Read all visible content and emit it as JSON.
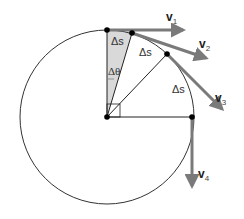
{
  "diagram": {
    "circle": {
      "cx": 107,
      "cy": 117,
      "r": 87,
      "stroke": "#333333"
    },
    "colors": {
      "arrow": "#7a7a7a",
      "wedge": "#d9d9d9",
      "line": "#222222",
      "point": "#000000"
    },
    "points": [
      {
        "id": "p1",
        "x": 107,
        "y": 30
      },
      {
        "id": "p2",
        "x": 132,
        "y": 33
      },
      {
        "id": "p3",
        "x": 167,
        "y": 54
      },
      {
        "id": "p4",
        "x": 192,
        "y": 117
      },
      {
        "id": "center",
        "x": 107,
        "y": 117
      }
    ],
    "vectors": [
      {
        "id": "v1",
        "label": "v",
        "sub": "1",
        "from": [
          107,
          30
        ],
        "to": [
          183,
          30
        ],
        "label_pos": [
          166,
          21
        ]
      },
      {
        "id": "v2",
        "label": "v",
        "sub": "2",
        "from": [
          132,
          33
        ],
        "to": [
          206,
          58
        ],
        "label_pos": [
          199,
          48
        ]
      },
      {
        "id": "v3",
        "label": "v",
        "sub": "3",
        "from": [
          167,
          54
        ],
        "to": [
          222,
          109
        ],
        "label_pos": [
          215,
          102
        ]
      },
      {
        "id": "v4",
        "label": "v",
        "sub": "4",
        "from": [
          192,
          117
        ],
        "to": [
          192,
          186
        ],
        "label_pos": [
          198,
          178
        ]
      }
    ],
    "arc_labels": [
      {
        "text": "Δs",
        "x": 113,
        "y": 45
      },
      {
        "text": "Δs",
        "x": 140,
        "y": 56
      },
      {
        "text": "Δs",
        "x": 173,
        "y": 93
      }
    ],
    "angle_label": {
      "text": "Δθ",
      "x": 108,
      "y": 75
    }
  }
}
